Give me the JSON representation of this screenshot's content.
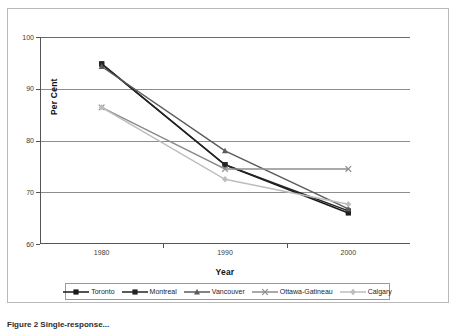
{
  "figure": {
    "caption": "Figure 2 Single-response...",
    "background": "#ffffff",
    "frame_color": "#b9b9b9"
  },
  "axis": {
    "y_label": "Per Cent",
    "x_label": "Year",
    "y_ticks": [
      "100",
      "90",
      "80",
      "70",
      "60"
    ],
    "x_ticks": [
      "1980",
      "1990",
      "2000"
    ]
  },
  "legend": {
    "items": [
      {
        "label": "Toronto",
        "color": "#1a1a1a",
        "marker": "square-marker"
      },
      {
        "label": "Montreal",
        "color": "#242424",
        "marker": "square-marker"
      },
      {
        "label": "Vancouver",
        "color": "#5b5b5b",
        "marker": "triangle-marker"
      },
      {
        "label": "Ottawa-Gatineau",
        "color": "#8e8e8e",
        "marker": "cross-marker"
      },
      {
        "label": "Calgary",
        "color": "#bdbdbd",
        "marker": "diamond-marker"
      }
    ]
  },
  "chart_data": {
    "type": "line",
    "title": "",
    "xlabel": "Year",
    "ylabel": "Per Cent",
    "x": [
      1980,
      1990,
      2000
    ],
    "categories": [
      "1980",
      "1990",
      "2000"
    ],
    "xlim": [
      1975,
      2005
    ],
    "ylim": [
      60,
      100
    ],
    "ytick_values": [
      100,
      90,
      80,
      70,
      60
    ],
    "grid": "horizontal",
    "legend_position": "bottom",
    "series": [
      {
        "name": "Toronto",
        "values": [
          94.8,
          75.3,
          66.0
        ],
        "color": "#1a1a1a",
        "marker": "square"
      },
      {
        "name": "Montreal",
        "values": [
          94.8,
          75.3,
          66.4
        ],
        "color": "#242424",
        "marker": "square"
      },
      {
        "name": "Vancouver",
        "values": [
          94.3,
          78.0,
          66.8
        ],
        "color": "#5b5b5b",
        "marker": "triangle"
      },
      {
        "name": "Ottawa-Gatineau",
        "values": [
          86.4,
          74.5,
          74.5
        ],
        "color": "#8e8e8e",
        "marker": "cross"
      },
      {
        "name": "Calgary",
        "values": [
          86.4,
          72.5,
          67.7
        ],
        "color": "#bdbdbd",
        "marker": "diamond"
      }
    ]
  }
}
